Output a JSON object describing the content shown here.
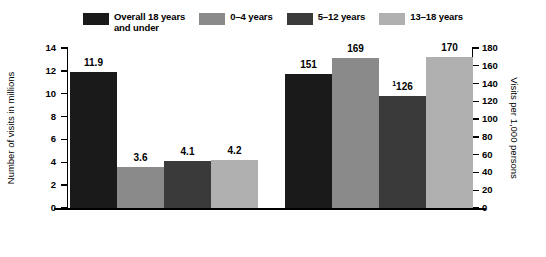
{
  "legend": {
    "items": [
      {
        "label": "Overall 18 years\nand under",
        "color": "#1a1a1a",
        "name": "legend-overall"
      },
      {
        "label": "0–4 years",
        "color": "#8a8a8a",
        "name": "legend-0-4"
      },
      {
        "label": "5–12 years",
        "color": "#3a3a3a",
        "name": "legend-5-12"
      },
      {
        "label": "13–18 years",
        "color": "#b0b0b0",
        "name": "legend-13-18"
      }
    ]
  },
  "axes": {
    "left_title": "Number of visits in millions",
    "right_title": "Visits per 1,000 persons",
    "left_ticks": [
      "0",
      "2",
      "4",
      "6",
      "8",
      "10",
      "12",
      "14"
    ],
    "right_ticks": [
      "0",
      "20",
      "40",
      "60",
      "80",
      "100",
      "120",
      "140",
      "160",
      "180"
    ]
  },
  "chart_data": {
    "type": "bar",
    "title": "",
    "xlabel": "",
    "ylabel": "Number of visits in millions",
    "ylabel_secondary": "Visits per 1,000 persons",
    "ylim": [
      0,
      14
    ],
    "ylim_secondary": [
      0,
      180
    ],
    "grid": false,
    "legend_position": "top-center",
    "categories": [
      "Overall 18 years and under",
      "0–4 years",
      "5–12 years",
      "13–18 years"
    ],
    "panels": [
      {
        "name": "Number of visits in millions",
        "axis": "left",
        "values": [
          11.9,
          3.6,
          4.1,
          4.2
        ],
        "labels": [
          "11.9",
          "3.6",
          "4.1",
          "4.2"
        ],
        "footnotes": [
          "",
          "",
          "",
          ""
        ]
      },
      {
        "name": "Visits per 1,000 persons",
        "axis": "right",
        "values": [
          151,
          169,
          126,
          170
        ],
        "labels": [
          "151",
          "169",
          "126",
          "170"
        ],
        "footnotes": [
          "",
          "",
          "1",
          ""
        ]
      }
    ]
  }
}
